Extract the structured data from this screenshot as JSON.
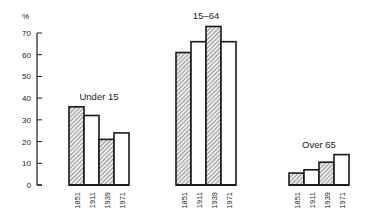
{
  "chart_data": {
    "type": "bar",
    "title": "",
    "xlabel": "",
    "ylabel": "%",
    "ylim": [
      0,
      70
    ],
    "yticks": [
      0,
      10,
      20,
      30,
      40,
      50,
      60,
      70
    ],
    "grid": false,
    "legend": null,
    "categories": [
      "1851",
      "1911",
      "1939",
      "1971"
    ],
    "groups": [
      {
        "name": "Under 15",
        "values": [
          36,
          32,
          21,
          24
        ]
      },
      {
        "name": "15–64",
        "values": [
          61,
          66,
          73,
          66
        ]
      },
      {
        "name": "Over 65",
        "values": [
          5.5,
          7,
          10.5,
          14
        ]
      }
    ],
    "bar_style": {
      "1851": "hatched",
      "1911": "white",
      "1939": "hatched",
      "1971": "white"
    }
  },
  "colors": {
    "ink": "#1a1a1a",
    "hatch_fill": "#e8e8e8",
    "background": "#ffffff"
  }
}
